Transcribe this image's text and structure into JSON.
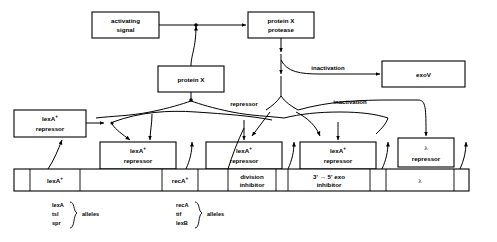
{
  "diagram": {
    "boxes": {
      "activating_signal": "activating\nsignal",
      "activating_signal_l1": "activating",
      "activating_signal_l2": "signal",
      "protein_x_protease_l1": "protein X",
      "protein_x_protease_l2": "protease",
      "protein_x": "protein X",
      "exov": "exoV",
      "lexa_repressor_l1": "lexA",
      "lexa_repressor_sup": "+",
      "lexa_repressor_l2": "repressor",
      "lambda_repressor_l1": "λ",
      "lambda_repressor_l2": "repressor"
    },
    "edge_labels": {
      "inactivation_exov": "inactivation",
      "inactivation_lambda": "inactivation",
      "repressor": "repressor"
    },
    "gene_bar": {
      "segments": [
        {
          "label": "lexA",
          "sup": "+",
          "line2": ""
        },
        {
          "label": "",
          "sup": "",
          "line2": ""
        },
        {
          "label": "recA",
          "sup": "+",
          "line2": ""
        },
        {
          "label": "",
          "sup": "",
          "line2": ""
        },
        {
          "label": "division",
          "sup": "",
          "line2": "inhibitor"
        },
        {
          "label": "",
          "sup": "",
          "line2": ""
        },
        {
          "label": "3' → 5' exo",
          "sup": "",
          "line2": "inhibitor"
        },
        {
          "label": "",
          "sup": "",
          "line2": ""
        },
        {
          "label": "λ",
          "sup": "",
          "line2": ""
        }
      ],
      "division_l1": "division",
      "division_l2": "inhibitor",
      "exo_l1": "3' → 5' exo",
      "exo_l2": "inhibitor",
      "lambda": "λ",
      "lexa": "lexA",
      "reca": "recA",
      "plus": "+"
    },
    "allele_groups": [
      {
        "name": "lexA-allele-group",
        "items": [
          "lexA",
          "tsl",
          "spr"
        ],
        "label": "alleles"
      },
      {
        "name": "recA-allele-group",
        "items": [
          "recA",
          "tif",
          "lexB"
        ],
        "label": "alleles"
      }
    ],
    "colors": {
      "stroke": "#000000",
      "background": "#ffffff",
      "text": "#000000"
    }
  }
}
